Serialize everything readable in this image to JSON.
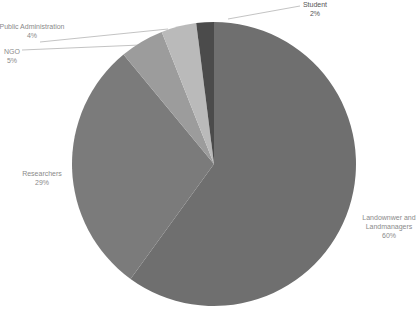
{
  "chart_data": {
    "type": "pie",
    "title": "",
    "start_angle_deg": 0,
    "direction": "clockwise",
    "center": [
      214,
      164
    ],
    "radius": 142,
    "categories": [
      "Landownwer and Landmanagers",
      "Researchers",
      "NGO",
      "Public Administration",
      "Student"
    ],
    "values": [
      60,
      29,
      5,
      4,
      2
    ],
    "value_labels": [
      "60%",
      "29%",
      "5%",
      "4%",
      "2%"
    ],
    "colors": [
      "#6f6f6f",
      "#7b7b7b",
      "#9c9c9c",
      "#bababa",
      "#4b4b4b"
    ],
    "legend": "none",
    "data_labels": "outside, category name and percentage"
  },
  "labels": {
    "landowner": {
      "line1": "Landownwer and",
      "line2": "Landmanagers",
      "pct": "60%"
    },
    "researchers": {
      "name": "Researchers",
      "pct": "29%"
    },
    "ngo": {
      "name": "NGO",
      "pct": "5%"
    },
    "public_admin": {
      "name": "Public Administration",
      "pct": "4%"
    },
    "student": {
      "name": "Student",
      "pct": "2%"
    }
  }
}
